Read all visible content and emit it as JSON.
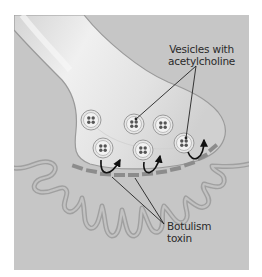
{
  "figure": {
    "type": "neuromuscular junction diagram",
    "colors": {
      "panel_background": "#c6c6c6",
      "axon_fill": "#e4e4e4",
      "axon_highlight": "#f2f2f2",
      "membrane_outline": "#9a9a9a",
      "postsynaptic_fold": "#a8a8a8",
      "receptor_block": "#8a8a8a",
      "vesicle_dot": "#555555",
      "arrow": "#111111",
      "leader_line": "#222222",
      "text": "#2a2a2a"
    }
  },
  "labels": {
    "vesicles": {
      "line1": "Vesicles with",
      "line2": "acetylcholine"
    },
    "toxin": {
      "line1": "Botulism",
      "line2": "toxin"
    }
  },
  "elements": {
    "vesicle_count": 6,
    "release_arrow_count": 3,
    "receptor_block_count": 12
  }
}
